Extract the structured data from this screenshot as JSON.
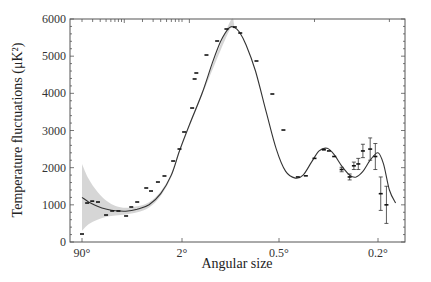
{
  "chart_data": {
    "type": "line",
    "title": "",
    "xlabel": "Angular size",
    "ylabel": "Temperature fluctuations (μK²)",
    "xscale": "angular (decreasing, hybrid log)",
    "ylim": [
      0,
      6000
    ],
    "grid": false,
    "legend": "none",
    "x_ticks": [
      {
        "value": 90,
        "label": "90°"
      },
      {
        "value": 2,
        "label": "2°"
      },
      {
        "value": 0.5,
        "label": "0.5°"
      },
      {
        "value": 0.2,
        "label": "0.2°"
      }
    ],
    "y_ticks": [
      {
        "value": 0,
        "label": "0"
      },
      {
        "value": 1000,
        "label": "1000"
      },
      {
        "value": 2000,
        "label": "2000"
      },
      {
        "value": 3000,
        "label": "3000"
      },
      {
        "value": 4000,
        "label": "4000"
      },
      {
        "value": 5000,
        "label": "5000"
      },
      {
        "value": 6000,
        "label": "6000"
      }
    ],
    "model_curve": {
      "name": "best-fit model",
      "x": [
        90,
        70,
        50,
        35,
        25,
        17,
        11,
        7,
        4.5,
        3,
        2.2,
        1.8,
        1.5,
        1.3,
        1.15,
        1.02,
        0.95,
        0.88,
        0.8,
        0.7,
        0.6,
        0.52,
        0.47,
        0.43,
        0.4,
        0.37,
        0.345,
        0.32,
        0.3,
        0.28,
        0.26,
        0.245,
        0.23,
        0.215,
        0.2,
        0.19,
        0.18,
        0.17
      ],
      "y": [
        1200,
        1080,
        960,
        880,
        840,
        830,
        880,
        1000,
        1300,
        1800,
        2450,
        3150,
        4000,
        4800,
        5400,
        5760,
        5780,
        5650,
        5300,
        4600,
        3500,
        2500,
        1900,
        1720,
        1800,
        2150,
        2450,
        2520,
        2350,
        2050,
        1800,
        1750,
        1900,
        2200,
        2400,
        2100,
        1400,
        1050
      ]
    },
    "uncertainty_band": {
      "name": "cosmic variance",
      "x": [
        90,
        70,
        50,
        35,
        25,
        17,
        11,
        7,
        4.5,
        3,
        2.2,
        1.5,
        1.02,
        0.95
      ],
      "lower": [
        300,
        480,
        600,
        680,
        710,
        740,
        800,
        930,
        1240,
        1750,
        2400,
        3950,
        5680,
        5700
      ],
      "upper": [
        2100,
        1700,
        1350,
        1100,
        970,
        920,
        960,
        1070,
        1360,
        1850,
        2500,
        4050,
        5880,
        5880
      ]
    },
    "points": {
      "name": "measurements",
      "x": [
        90,
        74,
        61,
        49,
        36,
        28.5,
        22.5,
        16.8,
        13.8,
        11,
        7.8,
        6.5,
        5,
        3.9,
        2.8,
        2.2,
        1.94,
        1.73,
        1.67,
        1.63,
        1.41,
        1.21,
        1.06,
        0.94,
        0.87,
        0.69,
        0.55,
        0.48,
        0.42,
        0.39,
        0.36,
        0.33,
        0.315,
        0.3,
        0.28,
        0.26,
        0.25,
        0.24,
        0.23,
        0.215,
        0.205,
        0.195,
        0.185
      ],
      "y": [
        215,
        1049,
        1100,
        1076,
        726,
        834,
        834,
        700,
        942,
        1076,
        1453,
        1372,
        1614,
        1776,
        2179,
        2502,
        2960,
        3605,
        4386,
        4547,
        5031,
        5408,
        5731,
        5785,
        5623,
        4870,
        3982,
        3013,
        1750,
        1780,
        2250,
        2480,
        2450,
        2300,
        1950,
        1750,
        2050,
        2100,
        2450,
        2500,
        2300,
        1300,
        1000
      ],
      "err": [
        0,
        0,
        0,
        0,
        0,
        0,
        0,
        0,
        0,
        0,
        0,
        0,
        0,
        0,
        0,
        0,
        0,
        0,
        0,
        0,
        0,
        0,
        0,
        0,
        0,
        0,
        0,
        0,
        0,
        0,
        0,
        0,
        0,
        0,
        60,
        80,
        100,
        150,
        180,
        300,
        350,
        450,
        500
      ]
    }
  }
}
